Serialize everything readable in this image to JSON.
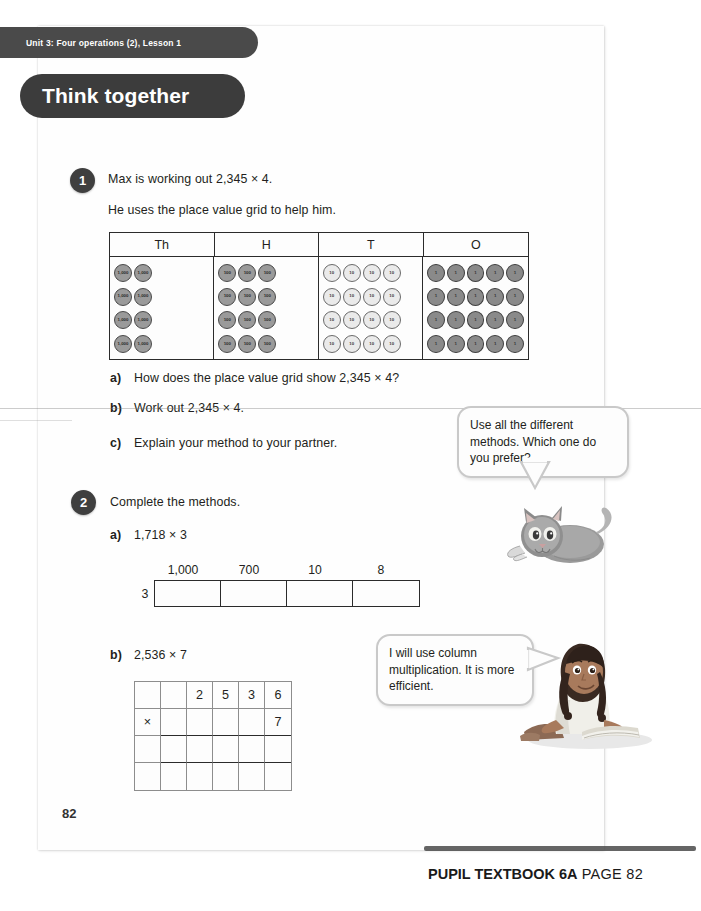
{
  "unit_tab": {
    "label": "Unit 3: Four operations (2), Lesson 1"
  },
  "banner": {
    "title": "Think together"
  },
  "questions": [
    {
      "number": "1",
      "lines": [
        "Max is working out 2,345 × 4.",
        "He uses the place value grid to help him."
      ],
      "parts": [
        {
          "label": "a)",
          "text": "How does the place value grid show 2,345 × 4?"
        },
        {
          "label": "b)",
          "text": "Work out 2,345 × 4."
        },
        {
          "label": "c)",
          "text": "Explain your method to your partner."
        }
      ]
    },
    {
      "number": "2",
      "lines": [
        "Complete the methods."
      ],
      "parts": [
        {
          "label": "a)",
          "text": "1,718 × 3"
        },
        {
          "label": "b)",
          "text": "2,536 × 7"
        }
      ]
    }
  ],
  "place_value_grid": {
    "headers": [
      "Th",
      "H",
      "T",
      "O"
    ],
    "rows": 4,
    "counters_per_row": [
      2,
      3,
      4,
      5
    ],
    "counter_labels": [
      "1,000",
      "100",
      "10",
      "1"
    ],
    "counter_styles": [
      "dark",
      "dark",
      "light",
      "darkest"
    ],
    "represents": "2,345 × 4"
  },
  "partition_box": {
    "multiplier": "3",
    "labels": [
      "1,000",
      "700",
      "10",
      "8"
    ],
    "cells": [
      "",
      "",
      "",
      ""
    ]
  },
  "column_grid": {
    "rows": [
      [
        "",
        "",
        "2",
        "5",
        "3",
        "6"
      ],
      [
        "×",
        "",
        "",
        "",
        "",
        "7"
      ],
      [
        "",
        "",
        "",
        "",
        "",
        ""
      ],
      [
        "",
        "",
        "",
        "",
        "",
        ""
      ]
    ]
  },
  "bubbles": [
    {
      "id": "cat-bubble",
      "text": "Use all the different methods. Which one do you prefer?"
    },
    {
      "id": "girl-bubble",
      "text": "I will use column multiplication. It is more efficient."
    }
  ],
  "characters": [
    {
      "name": "cat-illustration",
      "description": "grey cat lying down"
    },
    {
      "name": "girl-illustration",
      "description": "girl with braids reading a book"
    }
  ],
  "page_number": "82",
  "footer": {
    "book": "PUPIL TEXTBOOK 6A",
    "page": "PAGE 82"
  }
}
